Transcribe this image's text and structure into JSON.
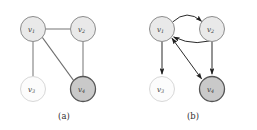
{
  "figure": {
    "type": "graph-diagram-pair",
    "background_color": "#ffffff",
    "panels": [
      {
        "id": "a",
        "caption": "(a)",
        "graph_kind": "undirected",
        "nodes": [
          {
            "id": "v1",
            "label": "v",
            "subscript": "1",
            "cx": 33,
            "cy": 29,
            "r": 12.5,
            "fill": "#e9e9e9",
            "stroke": "#8c8c8c",
            "stroke_width": 1.0
          },
          {
            "id": "v2",
            "label": "v",
            "subscript": "2",
            "cx": 83,
            "cy": 29,
            "r": 12.5,
            "fill": "#e9e9e9",
            "stroke": "#8c8c8c",
            "stroke_width": 1.0
          },
          {
            "id": "v3",
            "label": "v",
            "subscript": "3",
            "cx": 33,
            "cy": 89,
            "r": 12.5,
            "fill": "#fcfcfc",
            "stroke": "#d8d8d8",
            "stroke_width": 1.0
          },
          {
            "id": "v4",
            "label": "v",
            "subscript": "4",
            "cx": 83,
            "cy": 89,
            "r": 12.5,
            "fill": "#c9c9c9",
            "stroke": "#555555",
            "stroke_width": 1.3
          }
        ],
        "edges": [
          {
            "from": "v1",
            "to": "v2",
            "style": "straight",
            "directed": false
          },
          {
            "from": "v1",
            "to": "v3",
            "style": "straight",
            "directed": false
          },
          {
            "from": "v1",
            "to": "v4",
            "style": "straight",
            "directed": false
          },
          {
            "from": "v2",
            "to": "v4",
            "style": "straight",
            "directed": false
          }
        ]
      },
      {
        "id": "b",
        "caption": "(b)",
        "graph_kind": "directed",
        "nodes": [
          {
            "id": "v1",
            "label": "v",
            "subscript": "1",
            "cx": 33,
            "cy": 29,
            "r": 12.5,
            "fill": "#e9e9e9",
            "stroke": "#8c8c8c",
            "stroke_width": 1.0
          },
          {
            "id": "v2",
            "label": "v",
            "subscript": "2",
            "cx": 83,
            "cy": 29,
            "r": 12.5,
            "fill": "#e9e9e9",
            "stroke": "#8c8c8c",
            "stroke_width": 1.0
          },
          {
            "id": "v3",
            "label": "v",
            "subscript": "3",
            "cx": 33,
            "cy": 89,
            "r": 12.5,
            "fill": "#fcfcfc",
            "stroke": "#d8d8d8",
            "stroke_width": 1.0
          },
          {
            "id": "v4",
            "label": "v",
            "subscript": "4",
            "cx": 83,
            "cy": 89,
            "r": 12.5,
            "fill": "#c9c9c9",
            "stroke": "#555555",
            "stroke_width": 1.3
          }
        ],
        "edges": [
          {
            "from": "v1",
            "to": "v2",
            "style": "curve-up",
            "directed": true,
            "arrow_at": "to"
          },
          {
            "from": "v2",
            "to": "v1",
            "style": "curve-down",
            "directed": true,
            "arrow_at": "to"
          },
          {
            "from": "v1",
            "to": "v3",
            "style": "straight",
            "directed": true,
            "arrow_at": "to"
          },
          {
            "from": "v1",
            "to": "v4",
            "style": "straight",
            "directed": true,
            "arrow_at": "both"
          },
          {
            "from": "v2",
            "to": "v4",
            "style": "straight",
            "directed": true,
            "arrow_at": "to"
          }
        ]
      }
    ],
    "edge_color": "#6e6e6e",
    "arrow_color": "#1f1f1f",
    "label_color": "#3a3a3a"
  }
}
